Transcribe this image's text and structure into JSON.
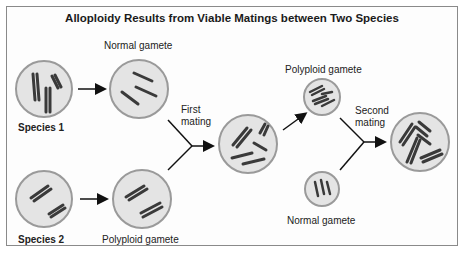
{
  "title": "Alloploidy Results from Viable Matings between Two Species",
  "labels": {
    "species1": "Species 1",
    "species2": "Species 2",
    "normal_gamete_top": "Normal gamete",
    "polyploid_gamete_bottom": "Polyploid gamete",
    "first_mating_line1": "First",
    "first_mating_line2": "mating",
    "polyploid_gamete_top": "Polyploid gamete",
    "normal_gamete_bottom": "Normal gamete",
    "second_mating_line1": "Second",
    "second_mating_line2": "mating"
  },
  "colors": {
    "cell_fill": "#e4e4e4",
    "cell_stroke": "#9a9a9a",
    "chromosome": "#3a3a3a",
    "arrow": "#111111"
  }
}
